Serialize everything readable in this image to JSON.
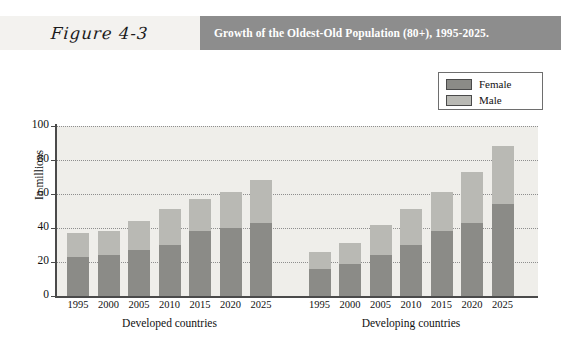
{
  "header": {
    "figure_label": "Figure 4-3",
    "title": "Growth of the Oldest-Old Population (80+), 1995-2025."
  },
  "legend": {
    "position": "top-right",
    "items": [
      {
        "label": "Female",
        "color": "#8b8b87"
      },
      {
        "label": "Male",
        "color": "#b9b9b4"
      }
    ]
  },
  "colors": {
    "female": "#8b8b87",
    "male": "#b9b9b4",
    "plot_background": "#efeeea",
    "axis": "#4a4a4a",
    "header_band": "#8d8d8d",
    "figure_cell": "#f3f2ef"
  },
  "chart_data": {
    "type": "bar",
    "subtype": "stacked",
    "title": "Growth of the Oldest-Old Population (80+), 1995-2025.",
    "xlabel": "",
    "ylabel": "In millions",
    "ylim": [
      0,
      100
    ],
    "yticks": [
      0,
      20,
      40,
      60,
      80,
      100
    ],
    "grid": true,
    "legend_position": "top-right",
    "groups": [
      "Developed countries",
      "Developing countries"
    ],
    "categories": [
      "1995",
      "2000",
      "2005",
      "2010",
      "2015",
      "2020",
      "2025"
    ],
    "series": [
      {
        "name": "Female",
        "color": "#8b8b87",
        "values_by_group": {
          "Developed countries": [
            23,
            24,
            27,
            30,
            38,
            40,
            43
          ],
          "Developing countries": [
            16,
            19,
            24,
            30,
            38,
            43,
            54
          ]
        }
      },
      {
        "name": "Male",
        "color": "#b9b9b4",
        "values_by_group": {
          "Developed countries": [
            14,
            14,
            17,
            21,
            19,
            21,
            25
          ],
          "Developing countries": [
            10,
            12,
            18,
            21,
            23,
            30,
            34
          ]
        }
      }
    ],
    "totals_by_group": {
      "Developed countries": [
        37,
        38,
        44,
        51,
        57,
        61,
        68
      ],
      "Developing countries": [
        26,
        31,
        42,
        51,
        61,
        73,
        88
      ]
    }
  }
}
